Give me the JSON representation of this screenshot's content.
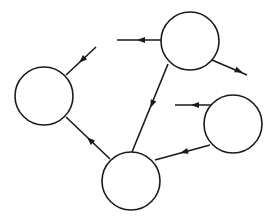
{
  "diagram": {
    "type": "directed-graph",
    "stroke_color": "#1a1a1a",
    "background": "#ffffff",
    "nodes": [
      {
        "id": "top",
        "cx": 190,
        "cy": 41,
        "r": 29,
        "label": ""
      },
      {
        "id": "left",
        "cx": 44,
        "cy": 96,
        "r": 29,
        "label": ""
      },
      {
        "id": "right",
        "cx": 233,
        "cy": 124,
        "r": 29,
        "label": ""
      },
      {
        "id": "bottom",
        "cx": 131,
        "cy": 181,
        "r": 29,
        "label": ""
      }
    ],
    "edges": [
      {
        "id": "top-out-left",
        "from": "top",
        "to": null,
        "x1": 161,
        "y1": 40,
        "x2": 117,
        "y2": 40,
        "arrow_at": [
          141,
          40
        ],
        "direction": "outgoing"
      },
      {
        "id": "top-out-right",
        "from": "top",
        "to": null,
        "x1": 212,
        "y1": 60,
        "x2": 247,
        "y2": 75,
        "arrow_at": [
          239,
          71
        ],
        "direction": "outgoing"
      },
      {
        "id": "left-in",
        "from": null,
        "to": "left",
        "x1": 96,
        "y1": 47,
        "x2": 66,
        "y2": 75,
        "arrow_at": [
          82,
          60
        ],
        "direction": "incoming"
      },
      {
        "id": "top-to-bottom",
        "from": "top",
        "to": "bottom",
        "x1": 168,
        "y1": 64,
        "x2": 132,
        "y2": 152,
        "arrow_at": [
          152,
          104
        ],
        "direction": "internal"
      },
      {
        "id": "bottom-to-left",
        "from": "bottom",
        "to": "left",
        "x1": 110,
        "y1": 159,
        "x2": 66,
        "y2": 117,
        "arrow_at": [
          90,
          140
        ],
        "direction": "internal"
      },
      {
        "id": "right-out-left",
        "from": "right",
        "to": null,
        "x1": 211,
        "y1": 105,
        "x2": 175,
        "y2": 105,
        "arrow_at": [
          195,
          105
        ],
        "direction": "outgoing"
      },
      {
        "id": "right-to-bottom",
        "from": "right",
        "to": "bottom",
        "x1": 210,
        "y1": 145,
        "x2": 155,
        "y2": 160,
        "arrow_at": [
          184,
          152
        ],
        "direction": "internal"
      }
    ]
  }
}
